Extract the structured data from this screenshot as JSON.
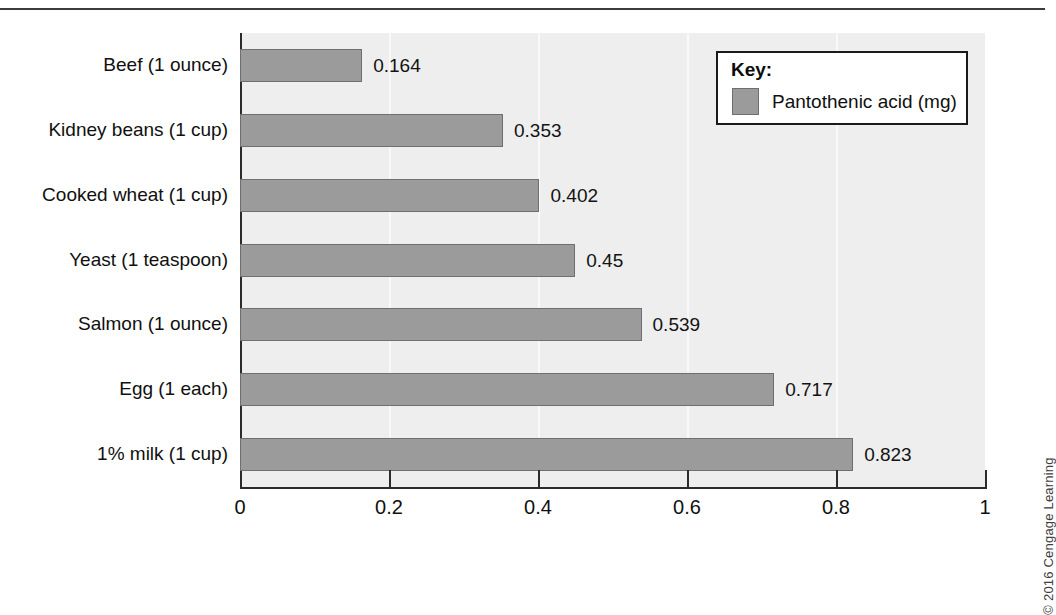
{
  "figure": {
    "copyright": "© 2016 Cengage Learning",
    "has_top_rule": true,
    "bar_color": "#9b9b9b",
    "bar_border_color": "#6f6f6f",
    "plot_background": "#eeeeee",
    "text_color": "#101010"
  },
  "legend": {
    "title": "Key:",
    "entries": [
      {
        "label": "Pantothenic acid (mg)",
        "color": "#9b9b9b"
      }
    ]
  },
  "chart_data": {
    "type": "bar",
    "orientation": "horizontal",
    "title": "",
    "xlabel": "",
    "ylabel": "",
    "xlim": [
      0,
      1
    ],
    "xticks": [
      0,
      0.2,
      0.4,
      0.6,
      0.8,
      1
    ],
    "xtick_labels": [
      "0",
      "0.2",
      "0.4",
      "0.6",
      "0.8",
      "1"
    ],
    "grid": true,
    "grid_axis": "x",
    "legend_position": "upper-right",
    "series_name": "Pantothenic acid (mg)",
    "units": "mg",
    "categories": [
      "Beef (1 ounce)",
      "Kidney beans (1 cup)",
      "Cooked wheat (1 cup)",
      "Yeast (1 teaspoon)",
      "Salmon (1 ounce)",
      "Egg (1 each)",
      "1% milk (1 cup)"
    ],
    "values": [
      0.164,
      0.353,
      0.402,
      0.45,
      0.539,
      0.717,
      0.823
    ],
    "value_labels": [
      "0.164",
      "0.353",
      "0.402",
      "0.45",
      "0.539",
      "0.717",
      "0.823"
    ]
  }
}
